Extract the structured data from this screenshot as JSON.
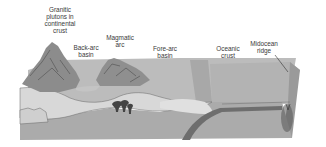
{
  "diagram": {
    "type": "subduction-zone cross-section",
    "labels": {
      "granitic_plutons": "Granitic\nplutons in\ncontinental\ncrust",
      "back_arc_basin": "Back-arc\nbasin",
      "magmatic_arc": "Magmatic\narc",
      "fore_arc_basin": "Fore-arc\nbasin",
      "oceanic_crust": "Oceanic\ncrust",
      "midocean_ridge": "Midocean\nridge"
    },
    "colors": {
      "mountain": "#8a8a8a",
      "surface": "#bdbdbd",
      "crust_light": "#d6d6d6",
      "mantle": "#a9a9a9",
      "slab": "#6f6f6f",
      "outline": "#555555"
    }
  }
}
